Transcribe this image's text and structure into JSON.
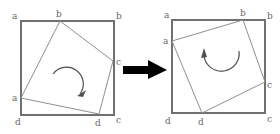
{
  "diagram": {
    "colors": {
      "outer_square": "#707070",
      "inner_square": "#909090",
      "rotation_arrow": "#505050",
      "transition_arrow": "#000000",
      "label": "#666666"
    },
    "left_panel": {
      "labels": {
        "outer_top_left": "a",
        "inner_top": "b",
        "outer_top_right": "b",
        "inner_right": "c",
        "inner_left": "a",
        "outer_bottom_left": "d",
        "inner_bottom": "d",
        "outer_bottom_right": "c"
      },
      "rotation_direction": "clockwise"
    },
    "transition_arrow": {
      "direction": "right"
    },
    "right_panel": {
      "labels": {
        "outer_top_left": "a",
        "inner_left": "a",
        "inner_top": "b",
        "outer_top_right": "b",
        "inner_right": "c",
        "outer_bottom_left": "d",
        "inner_bottom": "d",
        "outer_bottom_right": "c"
      },
      "rotation_direction": "counterclockwise"
    }
  }
}
